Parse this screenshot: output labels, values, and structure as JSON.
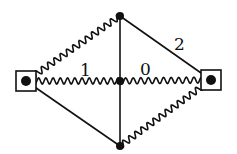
{
  "diagram": {
    "type": "feynman-like graph",
    "nodes": [
      {
        "id": "left",
        "kind": "boxed-vertex",
        "x": 26,
        "y": 81
      },
      {
        "id": "top",
        "kind": "vertex",
        "x": 120,
        "y": 16
      },
      {
        "id": "center",
        "kind": "vertex",
        "x": 120,
        "y": 81
      },
      {
        "id": "bottom",
        "kind": "vertex",
        "x": 120,
        "y": 146
      },
      {
        "id": "right",
        "kind": "boxed-vertex",
        "x": 211,
        "y": 80
      }
    ],
    "edges": [
      {
        "from": "left",
        "to": "top",
        "style": "wavy"
      },
      {
        "from": "left",
        "to": "center",
        "style": "wavy",
        "label": "1"
      },
      {
        "from": "center",
        "to": "right",
        "style": "wavy",
        "label": "0"
      },
      {
        "from": "top",
        "to": "right",
        "style": "straight",
        "label": "2"
      },
      {
        "from": "left",
        "to": "bottom",
        "style": "straight"
      },
      {
        "from": "bottom",
        "to": "right",
        "style": "wavy"
      },
      {
        "from": "top",
        "to": "bottom",
        "style": "straight"
      }
    ],
    "labels": {
      "edge_1": "1",
      "edge_0": "0",
      "edge_2": "2"
    }
  }
}
